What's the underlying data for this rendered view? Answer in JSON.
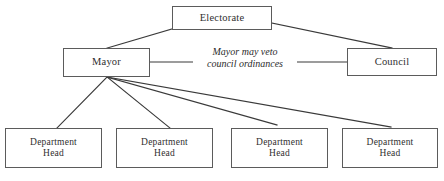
{
  "diagram": {
    "stroke_color": "#3a3a3a",
    "box_border_color": "#5b5b5b",
    "text_color": "#2f2f2f",
    "background_color": "#ffffff",
    "nodes": [
      {
        "id": "electorate",
        "label": "Electorate"
      },
      {
        "id": "mayor",
        "label": "Mayor"
      },
      {
        "id": "council",
        "label": "Council"
      },
      {
        "id": "dept1",
        "label": "Department\nHead"
      },
      {
        "id": "dept2",
        "label": "Department\nHead"
      },
      {
        "id": "dept3",
        "label": "Department\nHead"
      },
      {
        "id": "dept4",
        "label": "Department\nHead"
      }
    ],
    "annotations": [
      {
        "id": "veto-note",
        "text": "Mayor may veto\ncouncil ordinances",
        "style": "italic"
      }
    ],
    "edges": [
      {
        "from": "electorate",
        "to": "mayor"
      },
      {
        "from": "electorate",
        "to": "council"
      },
      {
        "from": "mayor",
        "to": "veto-note"
      },
      {
        "from": "veto-note",
        "to": "council"
      },
      {
        "from": "mayor",
        "to": "dept1"
      },
      {
        "from": "mayor",
        "to": "dept2"
      },
      {
        "from": "mayor",
        "to": "dept3"
      },
      {
        "from": "mayor",
        "to": "dept4"
      }
    ]
  }
}
